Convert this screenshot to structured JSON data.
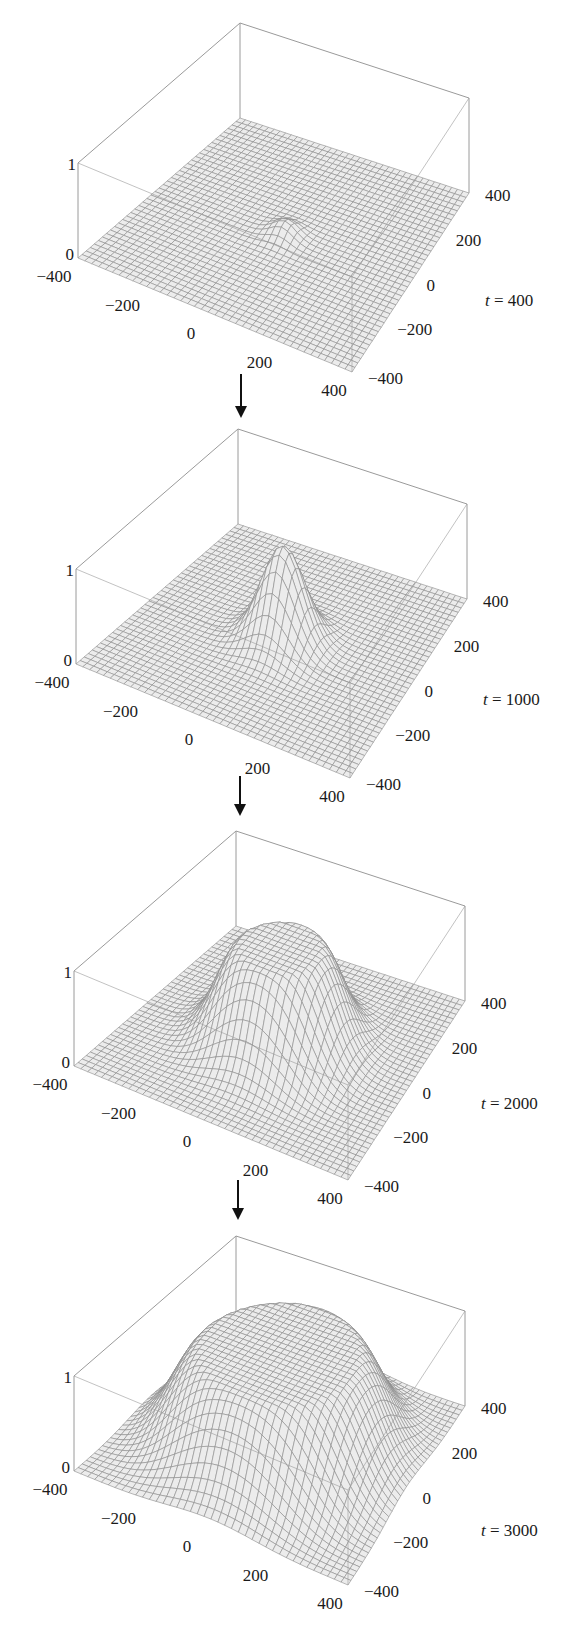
{
  "chart_data": {
    "type": "surface3d",
    "title": "",
    "xlabel": "",
    "ylabel": "",
    "zlabel": "",
    "xlim": [
      -400,
      400
    ],
    "ylim": [
      -400,
      400
    ],
    "zlim": [
      0,
      1
    ],
    "grid": "mesh ~40x40",
    "panels": [
      {
        "label_var": "t",
        "label_value": "400",
        "t": 400,
        "peak_height": 0.15,
        "front_radius": 0,
        "width": 35,
        "x_ticks": [
          "-400",
          "-200",
          "0",
          "200",
          "400"
        ],
        "y_ticks": [
          "400",
          "200",
          "0",
          "-200",
          "-400"
        ],
        "z_ticks": [
          "0",
          "1"
        ]
      },
      {
        "label_var": "t",
        "label_value": "1000",
        "t": 1000,
        "peak_height": 1.0,
        "front_radius": 0,
        "width": 62,
        "x_ticks": [
          "-400",
          "-200",
          "0",
          "200",
          "400"
        ],
        "y_ticks": [
          "400",
          "200",
          "0",
          "-200",
          "-400"
        ],
        "z_ticks": [
          "0",
          "1"
        ]
      },
      {
        "label_var": "t",
        "label_value": "2000",
        "t": 2000,
        "peak_height": 1.0,
        "front_radius": 110,
        "width": 70,
        "x_ticks": [
          "-400",
          "-200",
          "0",
          "200",
          "400"
        ],
        "y_ticks": [
          "400",
          "200",
          "0",
          "-200",
          "-400"
        ],
        "z_ticks": [
          "0",
          "1"
        ]
      },
      {
        "label_var": "t",
        "label_value": "3000",
        "t": 3000,
        "peak_height": 1.0,
        "front_radius": 215,
        "width": 85,
        "x_ticks": [
          "-400",
          "-200",
          "0",
          "200",
          "400"
        ],
        "y_ticks": [
          "400",
          "200",
          "0",
          "-200",
          "-400"
        ],
        "z_ticks": [
          "0",
          "1"
        ]
      }
    ],
    "arrows": 3,
    "colors": {
      "mesh_line": "#8a8a8a",
      "surface_fill": "#ececec",
      "box_line": "#9a9a9a",
      "arrow": "#111111"
    }
  },
  "panels": [
    {
      "time_label_var": "t",
      "time_label_eq": " = 400"
    },
    {
      "time_label_var": "t",
      "time_label_eq": " = 1000"
    },
    {
      "time_label_var": "t",
      "time_label_eq": " = 2000"
    },
    {
      "time_label_var": "t",
      "time_label_eq": " = 3000"
    }
  ]
}
